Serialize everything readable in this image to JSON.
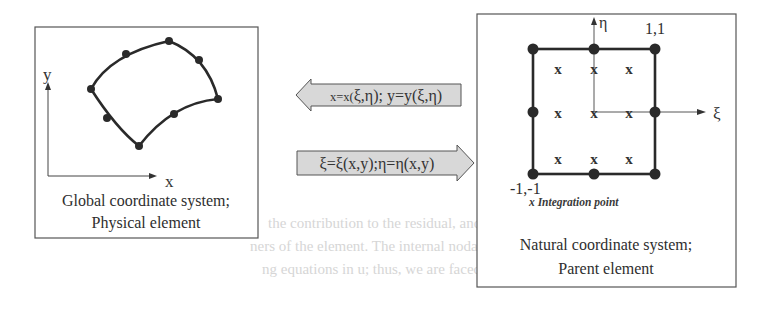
{
  "physical_panel": {
    "axis_x_label": "x",
    "axis_y_label": "y",
    "caption_line1": "Global coordinate system;",
    "caption_line2": "Physical element"
  },
  "mapping_arrows": {
    "to_physical": {
      "direction": "left",
      "p1": "x=x(",
      "p2": "ξ,η",
      "p3": "); y=y(",
      "p4": "ξ,η",
      "p5": ")",
      "full": "x=x(ξ,η); y=y(ξ,η)"
    },
    "to_natural": {
      "direction": "right",
      "full": "ξ=ξ(x,y);η=η(x,y)"
    }
  },
  "natural_panel": {
    "axis_xi_label": "ξ",
    "axis_eta_label": "η",
    "corner_top_right": "1,1",
    "corner_bottom_left": "-1,-1",
    "integration_marker": "x",
    "legend": "x Integration point",
    "caption_line1": "Natural coordinate system;",
    "caption_line2": "Parent element",
    "node_count": 8,
    "integration_grid": "3x3"
  },
  "background_text": [
    "the contribution to the residual, and both P and",
    "ners of the element. The internal nodal force vector P is a function",
    "ng equations in u; thus, we are faced with a nonlinear problem."
  ]
}
